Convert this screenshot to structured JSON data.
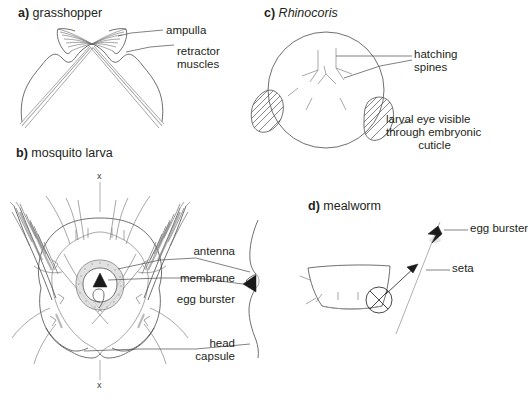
{
  "figure": {
    "background_color": "#ffffff",
    "line_color": "#4a4a4a",
    "text_color": "#231f20",
    "width": 483,
    "height": 399
  },
  "panels": {
    "a": {
      "letter": "a)",
      "title": "grasshopper",
      "labels": [
        {
          "text": "ampulla"
        },
        {
          "text": "retractor",
          "text2": "muscles"
        }
      ]
    },
    "b": {
      "letter": "b)",
      "title": "mosquito larva",
      "axis_marks": [
        {
          "text": "x"
        },
        {
          "text": "x"
        }
      ],
      "labels": [
        {
          "text": "antenna"
        },
        {
          "text": "membrane"
        },
        {
          "text": "egg burster"
        },
        {
          "text": "head",
          "text2": "capsule"
        }
      ]
    },
    "c": {
      "letter": "c)",
      "title": "Rhinocoris",
      "title_style": "italic",
      "labels": [
        {
          "text": "hatching",
          "text2": "spines"
        },
        {
          "text": "larval eye visible",
          "text2": "through embryonic",
          "text3": "cuticle"
        }
      ]
    },
    "d": {
      "letter": "d)",
      "title": "mealworm",
      "labels": [
        {
          "text": "egg burster"
        },
        {
          "text": "seta"
        }
      ]
    }
  }
}
